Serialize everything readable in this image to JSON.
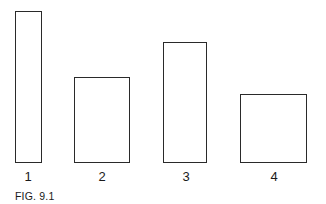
{
  "figure": {
    "caption": "FIG. 9.1",
    "rectangles": [
      {
        "label": "1",
        "x": 15,
        "y": 11,
        "w": 27,
        "h": 152
      },
      {
        "label": "2",
        "x": 74,
        "y": 77,
        "w": 56,
        "h": 86
      },
      {
        "label": "3",
        "x": 163,
        "y": 42,
        "w": 44,
        "h": 121
      },
      {
        "label": "4",
        "x": 240,
        "y": 94,
        "w": 67,
        "h": 69
      }
    ]
  }
}
